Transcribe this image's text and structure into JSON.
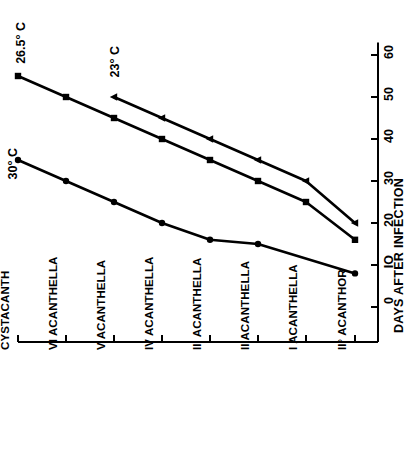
{
  "chart_data": {
    "type": "line",
    "title": "",
    "orientation": "rotated-90",
    "xlabel": "",
    "ylabel": "DAYS AFTER INFECTION",
    "categories": [
      "CYSTACANTH",
      "VI ACANTHELLA",
      "V ACANTHELLA",
      "IV ACANTHELLA",
      "III ACANTHELLA",
      "II ACANTHELLA",
      "I ACANTHELLA",
      "II° ACANTHOR"
    ],
    "ylim": [
      0,
      63
    ],
    "yticks": [
      0,
      10,
      20,
      30,
      40,
      50,
      60
    ],
    "ytick_labels": [
      "0",
      "IO",
      "20",
      "30",
      "40",
      "50",
      "60"
    ],
    "grid": false,
    "legend": "inline-annotations",
    "series": [
      {
        "name": "26.5° C",
        "marker": "square",
        "color": "#000000",
        "values": [
          55,
          50,
          45,
          40,
          35,
          30,
          25,
          16
        ]
      },
      {
        "name": "23° C",
        "marker": "triangle",
        "color": "#000000",
        "values": [
          null,
          null,
          50,
          45,
          40,
          35,
          30,
          20
        ]
      },
      {
        "name": "30° C",
        "marker": "circle",
        "color": "#000000",
        "values": [
          35,
          30,
          25,
          20,
          16,
          15,
          null,
          8
        ]
      }
    ]
  },
  "annotations": [
    {
      "text": "26.5° C"
    },
    {
      "text": "23° C"
    },
    {
      "text": "30° C"
    }
  ]
}
